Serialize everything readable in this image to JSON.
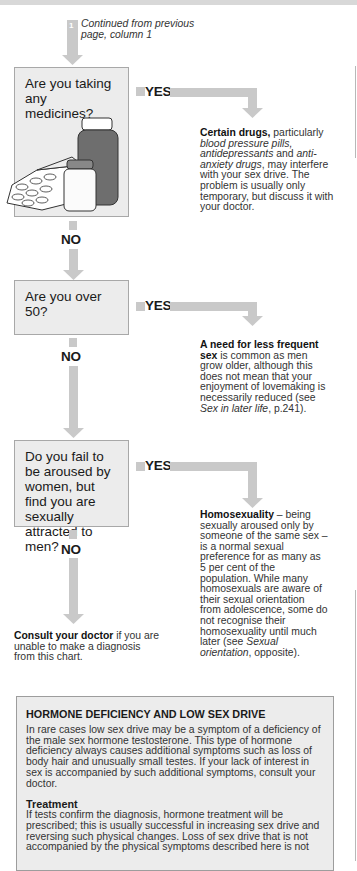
{
  "flowchart": {
    "continued_from": {
      "marker": "1",
      "text": "Continued from previous page, column 1"
    },
    "colors": {
      "arrow": "#c9c9c9",
      "question_box_bg": "#ececec",
      "question_box_border": "#a8a8a8"
    },
    "questions": [
      {
        "question": "Are you taking any medicines?",
        "yes_label": "YES",
        "no_label": "NO",
        "illustration": "medicine-bottles-and-pills",
        "answer": {
          "bold": "Certain drugs,",
          "pre_italic": " particularly ",
          "italic1": "blood pressure pills, antidepressants",
          "mid": " and ",
          "italic2": "anti-anxiety drugs",
          "rest": ", may interfere with your sex drive. The problem is usually only temporary, but discuss it with your doctor."
        }
      },
      {
        "question": "Are you over 50?",
        "yes_label": "YES",
        "no_label": "NO",
        "answer": {
          "bold": "A need for less frequent sex",
          "rest": " is common as men grow older, although this does not mean that your enjoyment of lovemaking is necessarily reduced (see ",
          "italic_ref": "Sex in later life",
          "ref_tail": ", p.241)."
        }
      },
      {
        "question": "Do you fail to be aroused by women, but find you are sexually attracted to men?",
        "yes_label": "YES",
        "no_label": "NO",
        "answer": {
          "bold": "Homosexuality",
          "rest": " – being sexually aroused only by someone of the same sex – is a normal sexual preference for as many as 5 per cent of the population. While many homosexuals are aware of their sexual orientation from adolescence, some do not recognise their homosexuality until much later (see ",
          "italic_ref": "Sexual orientation",
          "ref_tail": ", opposite)."
        }
      }
    ],
    "consult": {
      "bold": "Consult your doctor",
      "rest": " if you are unable to make a diagnosis from this chart."
    }
  },
  "sidebox": {
    "title": "HORMONE DEFICIENCY AND LOW SEX DRIVE",
    "body": "In rare cases low sex drive may be a symptom of a deficiency of the male sex hormone testosterone. This type of hormone deficiency always causes additional symptoms such as loss of body hair and unusually small testes. If your lack of interest in sex is accompanied by such additional symptoms, consult your doctor.",
    "treatment_heading": "Treatment",
    "treatment_body": "If tests confirm the diagnosis, hormone treatment will be prescribed; this is usually successful in increasing sex drive and reversing such physical changes. Loss of sex drive that is not accompanied by the physical symptoms described here is not"
  }
}
